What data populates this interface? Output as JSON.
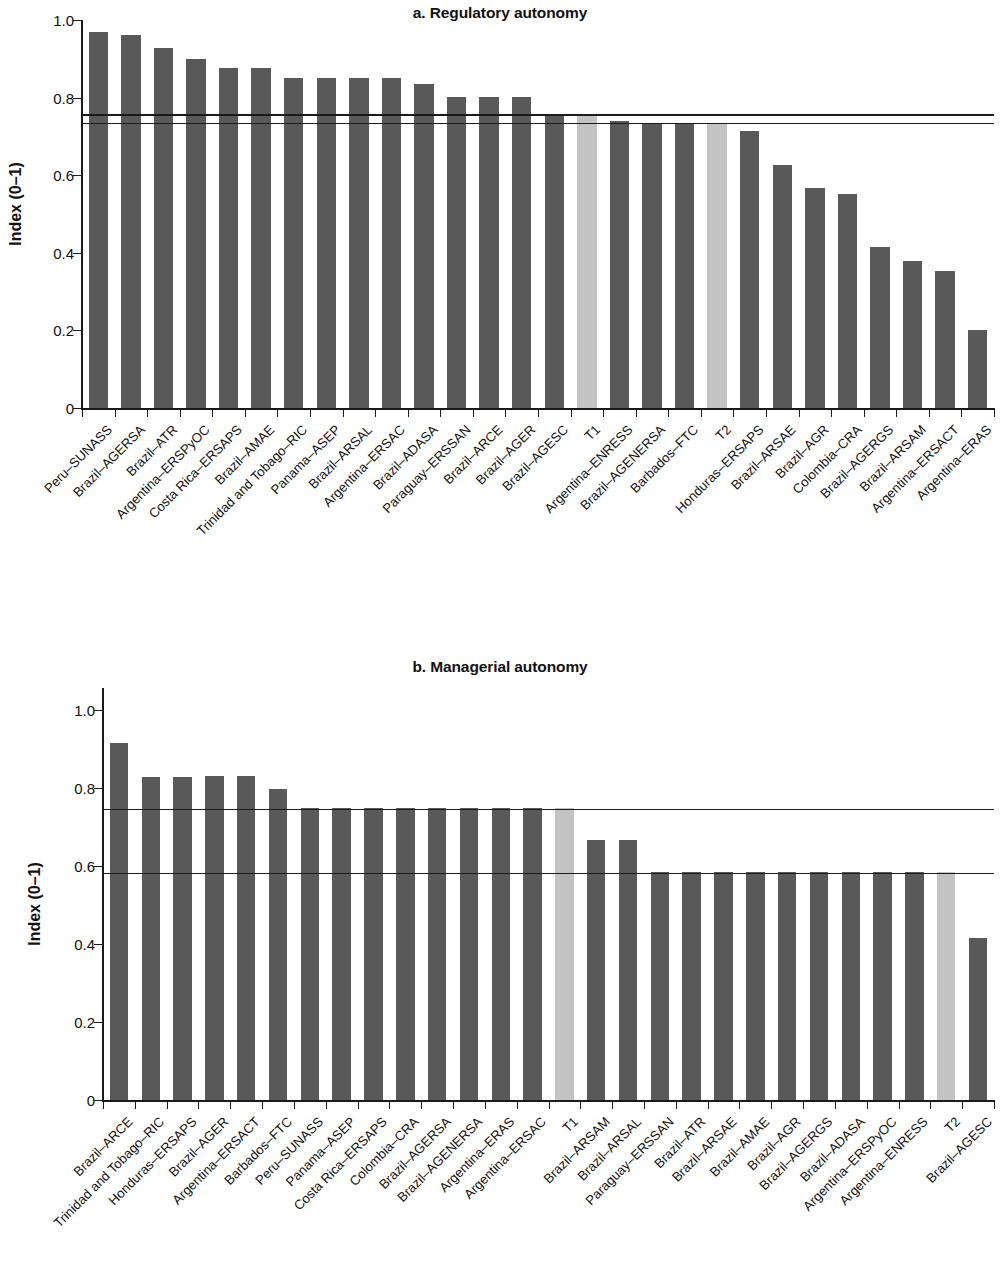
{
  "figure": {
    "axis_label": "Index (0–1)",
    "colors": {
      "bar_dark": "#595959",
      "bar_light": "#c3c3c3",
      "axis": "#1a1a1a",
      "background": "#ffffff"
    }
  },
  "chart_data": [
    {
      "type": "bar",
      "title": "a. Regulatory autonomy",
      "xlabel": "",
      "ylabel": "Index (0–1)",
      "ylim": [
        0,
        1.0
      ],
      "yticks": [
        0,
        0.2,
        0.4,
        0.6,
        0.8,
        1.0
      ],
      "ytick_labels": [
        "0",
        "0.2",
        "0.4",
        "0.6",
        "0.8",
        "1.0"
      ],
      "grid": false,
      "legend": "none",
      "reference_lines": [
        0.757,
        0.735
      ],
      "highlight_color": "#c3c3c3",
      "highlight_categories": [
        "T1",
        "T2"
      ],
      "categories": [
        "Peru–SUNASS",
        "Brazil–AGERSA",
        "Brazil–ATR",
        "Argentina–ERSPyOC",
        "Costa Rica–ERSAPS",
        "Brazil–AMAE",
        "Trinidad and Tobago–RIC",
        "Panama–ASEP",
        "Brazil–ARSAL",
        "Argentina–ERSAC",
        "Brazil–ADASA",
        "Paraguay–ERSSAN",
        "Brazil–ARCE",
        "Brazil–AGER",
        "Brazil–AGESC",
        "T1",
        "Argentina–ENRESS",
        "Brazil–AGENERSA",
        "Barbados–FTC",
        "T2",
        "Honduras–ERSAPS",
        "Brazil–ARSAE",
        "Brazil–AGR",
        "Colombia–CRA",
        "Brazil–AGERGS",
        "Brazil–ARSAM",
        "Argentina–ERSACT",
        "Argentina–ERAS"
      ],
      "values": [
        0.968,
        0.962,
        0.928,
        0.9,
        0.876,
        0.876,
        0.851,
        0.851,
        0.851,
        0.851,
        0.836,
        0.801,
        0.801,
        0.801,
        0.752,
        0.752,
        0.74,
        0.733,
        0.733,
        0.733,
        0.714,
        0.626,
        0.568,
        0.552,
        0.415,
        0.378,
        0.353,
        0.201
      ]
    },
    {
      "type": "bar",
      "title": "b. Managerial autonomy",
      "xlabel": "",
      "ylabel": "Index (0–1)",
      "ylim": [
        0,
        1.0
      ],
      "yticks": [
        0,
        0.2,
        0.4,
        0.6,
        0.8,
        1.0
      ],
      "ytick_labels": [
        "0",
        "0.2",
        "0.4",
        "0.6",
        "0.8",
        "1.0"
      ],
      "grid": false,
      "legend": "none",
      "reference_lines": [
        0.747,
        0.583
      ],
      "highlight_color": "#c3c3c3",
      "highlight_categories": [
        "T1",
        "T2"
      ],
      "categories": [
        "Brazil–ARCE",
        "Trinidad and Tobago–RIC",
        "Honduras–ERSAPS",
        "Brazil–AGER",
        "Argentina–ERSACT",
        "Barbados–FTC",
        "Peru–SUNASS",
        "Panama–ASEP",
        "Costa Rica–ERSAPS",
        "Colombia–CRA",
        "Brazil–AGERSA",
        "Brazil–AGENERSA",
        "Argentina–ERAS",
        "Argentina–ERSAC",
        "T1",
        "Brazil–ARSAM",
        "Brazil–ARSAL",
        "Paraguay–ERSSAN",
        "Brazil–ATR",
        "Brazil–ARSAE",
        "Brazil–AMAE",
        "Brazil–AGR",
        "Brazil–AGERGS",
        "Brazil–ADASA",
        "Argentina–ERSPyOC",
        "Argentina–ENRESS",
        "T2",
        "Brazil–AGESC"
      ],
      "values": [
        0.915,
        0.829,
        0.829,
        0.83,
        0.831,
        0.798,
        0.75,
        0.75,
        0.75,
        0.75,
        0.75,
        0.75,
        0.75,
        0.75,
        0.75,
        0.666,
        0.667,
        0.585,
        0.585,
        0.585,
        0.585,
        0.585,
        0.585,
        0.585,
        0.585,
        0.585,
        0.585,
        0.415
      ]
    }
  ]
}
